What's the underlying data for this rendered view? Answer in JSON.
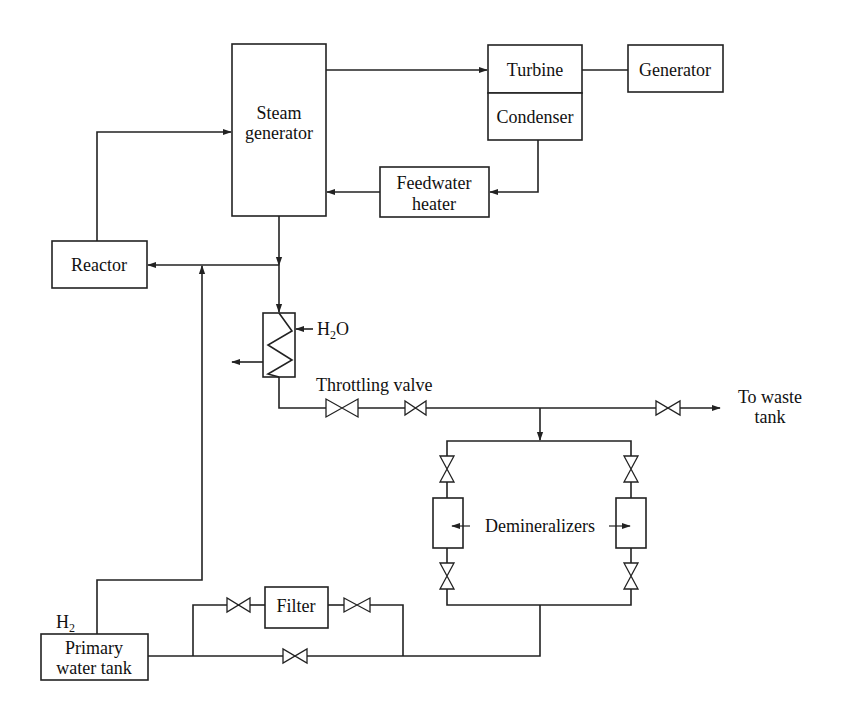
{
  "diagram": {
    "type": "process-flow",
    "components": {
      "steam_generator": {
        "line1": "Steam",
        "line2": "generator"
      },
      "turbine": {
        "label": "Turbine"
      },
      "condenser": {
        "label": "Condenser"
      },
      "generator": {
        "label": "Generator"
      },
      "feedwater_heater": {
        "line1": "Feedwater",
        "line2": "heater"
      },
      "reactor": {
        "label": "Reactor"
      },
      "heat_exchanger": {
        "coolant_label": "H",
        "coolant_sub": "2",
        "coolant_suffix": "O"
      },
      "throttling_valve": {
        "label": "Throttling valve"
      },
      "waste": {
        "line1": "To waste",
        "line2": "tank"
      },
      "demineralizers": {
        "label": "Demineralizers"
      },
      "filter": {
        "label": "Filter"
      },
      "primary_water_tank": {
        "line1": "Primary",
        "line2": "water tank",
        "gas_label": "H",
        "gas_sub": "2"
      }
    },
    "flows": [
      {
        "from": "Steam generator",
        "to": "Turbine"
      },
      {
        "from": "Turbine",
        "to": "Generator"
      },
      {
        "from": "Condenser",
        "to": "Feedwater heater"
      },
      {
        "from": "Feedwater heater",
        "to": "Steam generator"
      },
      {
        "from": "Reactor",
        "to": "Steam generator"
      },
      {
        "from": "Steam generator",
        "to": "Reactor"
      },
      {
        "from": "Steam generator",
        "to": "Heat exchanger"
      },
      {
        "from": "Heat exchanger",
        "to": "Throttling valve"
      },
      {
        "from": "Throttling valve",
        "to": "To waste tank"
      },
      {
        "from": "Throttling valve",
        "to": "Demineralizers"
      },
      {
        "from": "Demineralizers",
        "to": "Filter"
      },
      {
        "from": "Filter",
        "to": "Primary water tank"
      },
      {
        "from": "Primary water tank",
        "to": "Reactor"
      }
    ],
    "colors": {
      "line": "#222222",
      "background": "#ffffff"
    }
  }
}
